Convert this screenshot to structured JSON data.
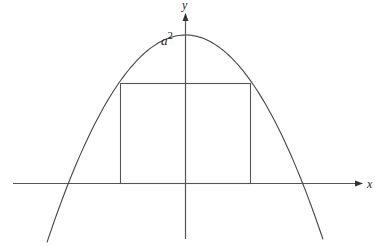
{
  "diagram": {
    "title": "",
    "axes": {
      "x_label": "x",
      "y_label": "y"
    },
    "curve": {
      "type": "parabola",
      "equation": "y = a^2 - x^2",
      "vertex_label_base": "a",
      "vertex_label_exp": "2"
    },
    "rectangle": {
      "description": "rectangle inscribed under parabola, base on x-axis"
    },
    "colors": {
      "stroke": "#333333",
      "text": "#222222"
    }
  }
}
